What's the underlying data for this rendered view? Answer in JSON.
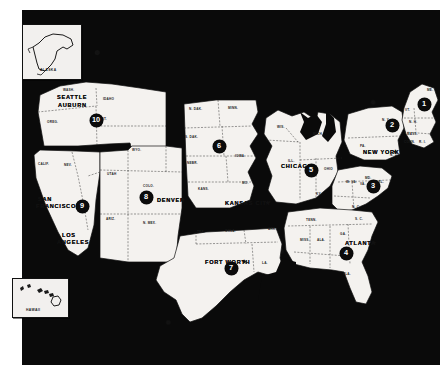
{
  "map": {
    "title": "United States Regional District Map",
    "background_color": "#0a0a0a",
    "land_color": "#f4f2ef",
    "ink_color": "#111111"
  },
  "insets": [
    {
      "name": "alaska-inset",
      "label": "ALASKA"
    },
    {
      "name": "hawaii-inset",
      "label": "HAWAII"
    }
  ],
  "districts": [
    {
      "number": "1",
      "region": "New England",
      "x": 424,
      "y": 104
    },
    {
      "number": "2",
      "region": "New York",
      "x": 392,
      "y": 125
    },
    {
      "number": "3",
      "region": "Mid-Atlantic",
      "x": 373,
      "y": 186
    },
    {
      "number": "4",
      "region": "Southeast",
      "x": 346,
      "y": 253
    },
    {
      "number": "5",
      "region": "Great Lakes",
      "x": 311,
      "y": 170
    },
    {
      "number": "6",
      "region": "Upper Midwest",
      "x": 219,
      "y": 146
    },
    {
      "number": "7",
      "region": "Southwest",
      "x": 231,
      "y": 268
    },
    {
      "number": "8",
      "region": "Mountain",
      "x": 146,
      "y": 197
    },
    {
      "number": "9",
      "region": "Pacific",
      "x": 82,
      "y": 206
    },
    {
      "number": "10",
      "region": "Northwest",
      "x": 96,
      "y": 120
    }
  ],
  "cities": [
    {
      "label": "SEATTLE",
      "x": 57,
      "y": 94,
      "star": false
    },
    {
      "label": "AUBURN",
      "x": 58,
      "y": 102,
      "star": false
    },
    {
      "label": "SAN",
      "x": 38,
      "y": 196,
      "star": false
    },
    {
      "label": "FRANCISCO",
      "x": 36,
      "y": 203,
      "star": false
    },
    {
      "label": "LOS",
      "x": 62,
      "y": 232,
      "star": false
    },
    {
      "label": "ANGELES",
      "x": 57,
      "y": 239,
      "star": false
    },
    {
      "label": "DENVER",
      "x": 157,
      "y": 197,
      "star": true
    },
    {
      "label": "KANSAS CITY",
      "x": 225,
      "y": 200,
      "star": true
    },
    {
      "label": "FORT WORTH",
      "x": 205,
      "y": 259,
      "star": true
    },
    {
      "label": "CHICAGO",
      "x": 281,
      "y": 163,
      "star": false
    },
    {
      "label": "NEW YORK",
      "x": 363,
      "y": 149,
      "star": true
    },
    {
      "label": "ATLANTA",
      "x": 345,
      "y": 240,
      "star": true
    }
  ],
  "states": [
    {
      "label": "WASH.",
      "x": 63,
      "y": 88
    },
    {
      "label": "IDAHO",
      "x": 103,
      "y": 97
    },
    {
      "label": "OREG.",
      "x": 47,
      "y": 120
    },
    {
      "label": "MONT.",
      "x": 96,
      "y": 117
    },
    {
      "label": "WYO.",
      "x": 132,
      "y": 148
    },
    {
      "label": "CALIF.",
      "x": 38,
      "y": 162
    },
    {
      "label": "NEV.",
      "x": 64,
      "y": 163
    },
    {
      "label": "UTAH",
      "x": 107,
      "y": 172
    },
    {
      "label": "COLO.",
      "x": 143,
      "y": 184
    },
    {
      "label": "ARIZ.",
      "x": 106,
      "y": 217
    },
    {
      "label": "N. MEX.",
      "x": 143,
      "y": 221
    },
    {
      "label": "N. DAK.",
      "x": 189,
      "y": 107
    },
    {
      "label": "MINN.",
      "x": 228,
      "y": 106
    },
    {
      "label": "S. DAK.",
      "x": 185,
      "y": 135
    },
    {
      "label": "IOWA",
      "x": 235,
      "y": 154
    },
    {
      "label": "NEBR.",
      "x": 187,
      "y": 161
    },
    {
      "label": "KANS.",
      "x": 198,
      "y": 187
    },
    {
      "label": "MO.",
      "x": 242,
      "y": 181
    },
    {
      "label": "WIS.",
      "x": 277,
      "y": 125
    },
    {
      "label": "MICH.",
      "x": 313,
      "y": 132
    },
    {
      "label": "ILL.",
      "x": 288,
      "y": 159
    },
    {
      "label": "IND.",
      "x": 307,
      "y": 167
    },
    {
      "label": "OHIO",
      "x": 324,
      "y": 167
    },
    {
      "label": "KY.",
      "x": 316,
      "y": 192
    },
    {
      "label": "TENN.",
      "x": 306,
      "y": 218
    },
    {
      "label": "ARK.",
      "x": 268,
      "y": 227
    },
    {
      "label": "OKLA.",
      "x": 225,
      "y": 229
    },
    {
      "label": "TEX.",
      "x": 197,
      "y": 230
    },
    {
      "label": "LA.",
      "x": 262,
      "y": 261
    },
    {
      "label": "MISS.",
      "x": 300,
      "y": 238
    },
    {
      "label": "ALA.",
      "x": 317,
      "y": 238
    },
    {
      "label": "GA.",
      "x": 340,
      "y": 232
    },
    {
      "label": "FLA.",
      "x": 343,
      "y": 272
    },
    {
      "label": "S. C.",
      "x": 355,
      "y": 217
    },
    {
      "label": "N. C.",
      "x": 352,
      "y": 205
    },
    {
      "label": "VA.",
      "x": 360,
      "y": 182
    },
    {
      "label": "W. VA.",
      "x": 346,
      "y": 180
    },
    {
      "label": "MD.",
      "x": 365,
      "y": 176
    },
    {
      "label": "DEL.",
      "x": 376,
      "y": 180
    },
    {
      "label": "PA.",
      "x": 360,
      "y": 144
    },
    {
      "label": "N. Y.",
      "x": 382,
      "y": 118
    },
    {
      "label": "N. J.",
      "x": 390,
      "y": 153
    },
    {
      "label": "VT.",
      "x": 405,
      "y": 108
    },
    {
      "label": "N. H.",
      "x": 409,
      "y": 120
    },
    {
      "label": "MASS.",
      "x": 407,
      "y": 132
    },
    {
      "label": "CONN.",
      "x": 404,
      "y": 140
    },
    {
      "label": "R. I.",
      "x": 419,
      "y": 140
    },
    {
      "label": "ME.",
      "x": 427,
      "y": 88
    }
  ]
}
